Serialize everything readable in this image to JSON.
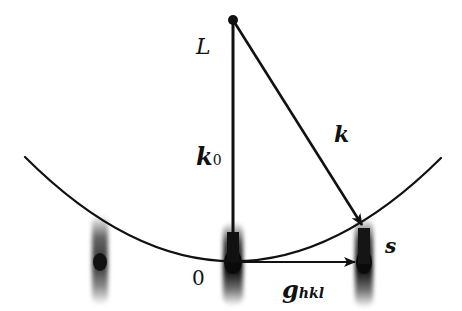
{
  "diagram": {
    "labels": {
      "L": "L",
      "k0": "k",
      "k0_sub": "0",
      "k": "k",
      "s": "s",
      "origin": "0",
      "g": "g",
      "g_sub": "hkl"
    },
    "colors": {
      "line": "#111111",
      "background": "#ffffff"
    },
    "geometry": {
      "L_point": [
        233,
        20
      ],
      "origin_point": [
        233,
        262
      ],
      "s_point": [
        363,
        226
      ],
      "arc_start": [
        25,
        157
      ],
      "arc_end": [
        441,
        158
      ],
      "spots_x": [
        100,
        233,
        363
      ]
    }
  }
}
